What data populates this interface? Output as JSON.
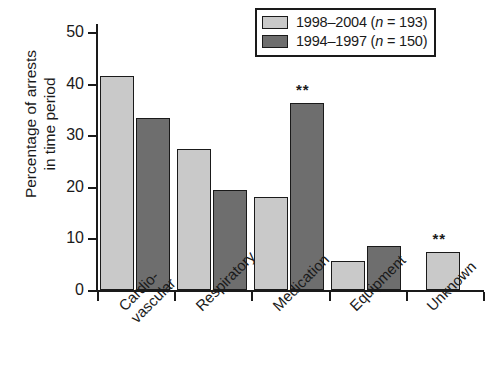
{
  "chart_data": {
    "type": "bar",
    "title": "",
    "xlabel": "",
    "ylabel_line1": "Percentage of arrests",
    "ylabel_line2": "in time period",
    "ylim": [
      0,
      50
    ],
    "yticks": [
      0,
      10,
      20,
      30,
      40,
      50
    ],
    "grid": false,
    "legend_position": "top-right",
    "categories": [
      "Cardio-\nvascular",
      "Respiratory",
      "Medication",
      "Equipment",
      "Unknown"
    ],
    "category_labels": [
      {
        "line1": "Cardio-",
        "line2": "vascular"
      },
      {
        "line1": "Respiratory",
        "line2": ""
      },
      {
        "line1": "Medication",
        "line2": ""
      },
      {
        "line1": "Equipment",
        "line2": ""
      },
      {
        "line1": "Unknown",
        "line2": ""
      }
    ],
    "series": [
      {
        "name": "1998–2004 (n = 193)",
        "legend_prefix": "1998–2004 (",
        "legend_italic": "n",
        "legend_suffix": " = 193)",
        "color": "#c9c9c9",
        "values": [
          41.4,
          27.3,
          18.0,
          5.6,
          7.3
        ]
      },
      {
        "name": "1994–1997 (n = 150)",
        "legend_prefix": "1994–1997 (",
        "legend_italic": "n",
        "legend_suffix": " = 150)",
        "color": "#6e6e6e",
        "values": [
          33.3,
          19.3,
          36.3,
          8.6,
          null
        ]
      }
    ],
    "annotations": [
      {
        "label": "**",
        "category": "Medication",
        "series": "1994–1997 (n = 150)"
      },
      {
        "label": "**",
        "category": "Unknown",
        "series": "1998–2004 (n = 193)"
      }
    ],
    "tick_labels": {
      "y": [
        "50",
        "40",
        "30",
        "20",
        "10",
        "0"
      ]
    }
  }
}
